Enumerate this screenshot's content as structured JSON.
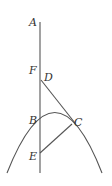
{
  "diagram": {
    "type": "geometry",
    "labels": {
      "A": "A",
      "F": "F",
      "D": "D",
      "B": "B",
      "C": "C",
      "E": "E"
    },
    "elements": [
      "vertical axis line through A, F, D, B, E",
      "parabola opening downward through B and C",
      "line from D to C extended",
      "segment from E to C"
    ],
    "colors": {
      "stroke": "#555555",
      "text": "#333333",
      "background": "#ffffff"
    }
  }
}
